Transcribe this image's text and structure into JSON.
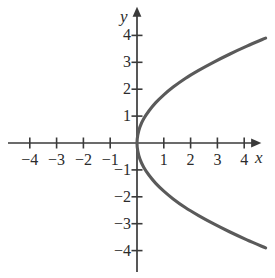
{
  "chart_data": {
    "type": "line",
    "title": "",
    "xlabel": "x",
    "ylabel": "y",
    "equation": "x = y^2/4",
    "xlim": [
      -4.8,
      5.2
    ],
    "ylim": [
      -4.4,
      4.6
    ],
    "grid": false,
    "legend": null,
    "axis_color": "#3a3a3a",
    "curve_color": "#5a5a5a",
    "label_color": "#2b2b2b",
    "x_ticks": [
      {
        "value": -4,
        "label": "−4"
      },
      {
        "value": -3,
        "label": "−3"
      },
      {
        "value": -2,
        "label": "−2"
      },
      {
        "value": -1,
        "label": "−1"
      },
      {
        "value": 1,
        "label": "1"
      },
      {
        "value": 2,
        "label": "2"
      },
      {
        "value": 3,
        "label": "3"
      },
      {
        "value": 4,
        "label": "4"
      }
    ],
    "y_ticks": [
      {
        "value": 4,
        "label": "4"
      },
      {
        "value": 3,
        "label": "3"
      },
      {
        "value": 2,
        "label": "2"
      },
      {
        "value": 1,
        "label": "1"
      },
      {
        "value": -1,
        "label": "−1"
      },
      {
        "value": -2,
        "label": "−2"
      },
      {
        "value": -3,
        "label": "−3"
      },
      {
        "value": -4,
        "label": "−4"
      }
    ],
    "series": [
      {
        "name": "x = y^2/4",
        "points": [
          {
            "x": 4.8,
            "y": 3.9
          },
          {
            "x": 4.1,
            "y": 3.6
          },
          {
            "x": 3.45,
            "y": 3.3
          },
          {
            "x": 2.85,
            "y": 3.0
          },
          {
            "x": 2.3,
            "y": 2.7
          },
          {
            "x": 1.8,
            "y": 2.4
          },
          {
            "x": 1.35,
            "y": 2.08
          },
          {
            "x": 1.0,
            "y": 1.79
          },
          {
            "x": 0.7,
            "y": 1.5
          },
          {
            "x": 0.45,
            "y": 1.2
          },
          {
            "x": 0.25,
            "y": 0.9
          },
          {
            "x": 0.11,
            "y": 0.6
          },
          {
            "x": 0.03,
            "y": 0.3
          },
          {
            "x": 0.0,
            "y": 0.0
          },
          {
            "x": 0.03,
            "y": -0.3
          },
          {
            "x": 0.11,
            "y": -0.6
          },
          {
            "x": 0.25,
            "y": -0.9
          },
          {
            "x": 0.45,
            "y": -1.2
          },
          {
            "x": 0.7,
            "y": -1.5
          },
          {
            "x": 1.0,
            "y": -1.79
          },
          {
            "x": 1.35,
            "y": -2.08
          },
          {
            "x": 1.8,
            "y": -2.4
          },
          {
            "x": 2.3,
            "y": -2.7
          },
          {
            "x": 2.85,
            "y": -3.0
          },
          {
            "x": 3.45,
            "y": -3.3
          },
          {
            "x": 4.1,
            "y": -3.6
          },
          {
            "x": 4.8,
            "y": -3.9
          }
        ]
      }
    ]
  }
}
